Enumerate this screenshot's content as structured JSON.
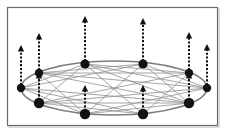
{
  "figure": {
    "canvas": {
      "width": 232,
      "height": 134
    },
    "background_color": "#ffffff"
  },
  "frame": {
    "x": 7.5,
    "y": 7.5,
    "width": 210,
    "height": 118,
    "stroke_color": "#6b6b6b",
    "fill_color": "#ffffff",
    "stroke_width": 1.2,
    "shadow_color": "#c9c9c9"
  },
  "ellipse": {
    "center_x": 114,
    "center_y": 88,
    "radius_x": 93,
    "radius_y": 27,
    "stroke_color": "#7d7d7d",
    "stroke_width": 1.6,
    "fill": "none"
  },
  "graph": {
    "node_count": 10,
    "node_color": "#121212",
    "edge_color": "#8f8f8f",
    "edge_width": 0.8,
    "nodes": [
      {
        "id": "n0",
        "label": "node-0",
        "x": 207,
        "y": 88,
        "r": 4.2,
        "angle_deg": 0,
        "arrow_length": 44
      },
      {
        "id": "n1",
        "label": "node-1",
        "x": 189,
        "y": 73,
        "r": 4.2,
        "angle_deg": 36,
        "arrow_length": 41
      },
      {
        "id": "n2",
        "label": "node-2",
        "x": 143,
        "y": 64,
        "r": 4.6,
        "angle_deg": 72,
        "arrow_length": 46
      },
      {
        "id": "n3",
        "label": "node-3",
        "x": 85,
        "y": 64,
        "r": 4.6,
        "angle_deg": 108,
        "arrow_length": 48
      },
      {
        "id": "n4",
        "label": "node-4",
        "x": 39,
        "y": 73,
        "r": 4.2,
        "angle_deg": 144,
        "arrow_length": 40
      },
      {
        "id": "n5",
        "label": "node-5",
        "x": 21,
        "y": 88,
        "r": 4.2,
        "angle_deg": 180,
        "arrow_length": 43
      },
      {
        "id": "n6",
        "label": "node-6",
        "x": 39,
        "y": 103,
        "r": 5.2,
        "angle_deg": 216,
        "arrow_length": 31
      },
      {
        "id": "n7",
        "label": "node-7",
        "x": 85,
        "y": 114,
        "r": 5.2,
        "angle_deg": 252,
        "arrow_length": 29
      },
      {
        "id": "n8",
        "label": "node-8",
        "x": 143,
        "y": 114,
        "r": 5.2,
        "angle_deg": 288,
        "arrow_length": 29
      },
      {
        "id": "n9",
        "label": "node-9",
        "x": 189,
        "y": 103,
        "r": 5.2,
        "angle_deg": 324,
        "arrow_length": 31
      }
    ],
    "chords": [
      [
        0,
        2
      ],
      [
        0,
        3
      ],
      [
        0,
        4
      ],
      [
        0,
        6
      ],
      [
        0,
        7
      ],
      [
        1,
        3
      ],
      [
        1,
        4
      ],
      [
        1,
        6
      ],
      [
        1,
        8
      ],
      [
        2,
        4
      ],
      [
        2,
        5
      ],
      [
        2,
        7
      ],
      [
        2,
        9
      ],
      [
        3,
        5
      ],
      [
        3,
        6
      ],
      [
        3,
        8
      ],
      [
        3,
        9
      ],
      [
        4,
        6
      ],
      [
        4,
        7
      ],
      [
        4,
        9
      ],
      [
        5,
        7
      ],
      [
        5,
        8
      ],
      [
        5,
        9
      ],
      [
        6,
        8
      ],
      [
        6,
        9
      ],
      [
        7,
        9
      ]
    ]
  },
  "arrows": {
    "color": "#111111",
    "shaft_width": 2.0,
    "dash_pattern": "2.1 1.7",
    "head_width": 6.4,
    "head_height": 6.4,
    "direction": "up",
    "count": 10
  }
}
